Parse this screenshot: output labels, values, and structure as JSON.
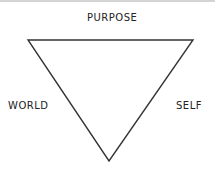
{
  "diagram": {
    "shape": "inverted-triangle",
    "labels": {
      "top": "PURPOSE",
      "left": "WORLD",
      "right": "SELF"
    },
    "stroke_color": "#333333",
    "background": "#ffffff"
  }
}
